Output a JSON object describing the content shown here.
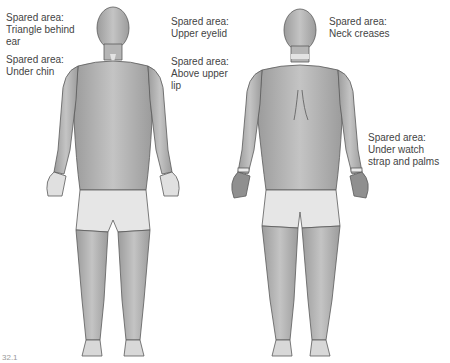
{
  "figure": {
    "views": [
      "front",
      "back"
    ],
    "figure_number": "32.1",
    "colors": {
      "skin_dark": "#a6a6a6",
      "skin_light": "#d9d9d9",
      "spared_area": "#e8e8e8",
      "outline": "#5a5a5a"
    }
  },
  "annotations": [
    {
      "id": "triangle-behind-ear",
      "text": "Spared area:\nTriangle behind\near"
    },
    {
      "id": "under-chin",
      "text": "Spared area:\nUnder chin"
    },
    {
      "id": "upper-eyelid",
      "text": "Spared area:\nUpper eyelid"
    },
    {
      "id": "above-upper-lip",
      "text": "Spared area:\nAbove upper\nlip"
    },
    {
      "id": "neck-creases",
      "text": "Spared area:\nNeck creases"
    },
    {
      "id": "under-watch-strap",
      "text": "Spared area:\nUnder watch\nstrap and palms"
    }
  ]
}
